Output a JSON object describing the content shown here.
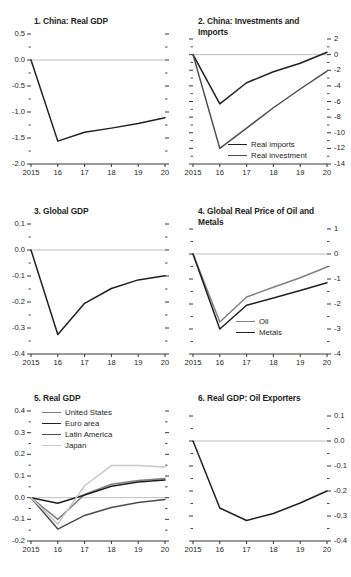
{
  "figure": {
    "width": 351,
    "height": 577,
    "background": "#ffffff",
    "x_categories": [
      "2015",
      "16",
      "17",
      "18",
      "19",
      "20"
    ]
  },
  "colors": {
    "axis": "#231f20",
    "zero_line": "#bfbfbf",
    "black": "#231f20",
    "dark_gray": "#4d4d4d",
    "mid_gray": "#808080",
    "light_gray": "#c4c4c4"
  },
  "chart_data": [
    {
      "id": "panel-1",
      "type": "line",
      "title": "1. China: Real GDP",
      "xlabel": "",
      "ylabel": "",
      "x": [
        "2015",
        "16",
        "17",
        "18",
        "19",
        "20"
      ],
      "xlim": [
        2015,
        2020
      ],
      "ylim": [
        -2.0,
        0.5
      ],
      "y_ticks": [
        "0.5",
        "0.0",
        "-0.5",
        "-1.0",
        "-1.5",
        "-2.0"
      ],
      "y_tick_values": [
        0.5,
        0.0,
        -0.5,
        -1.0,
        -1.5,
        -2.0
      ],
      "y_axis_side": "left",
      "minor_ticks": true,
      "grid": false,
      "zero_line": true,
      "legend": null,
      "series": [
        {
          "name": "China: Real GDP",
          "color": "#231f20",
          "values": [
            0.0,
            -1.56,
            -1.39,
            -1.31,
            -1.22,
            -1.11
          ]
        }
      ]
    },
    {
      "id": "panel-2",
      "type": "line",
      "title": "2. China: Investments and Imports",
      "xlabel": "",
      "ylabel": "",
      "x": [
        "2015",
        "16",
        "17",
        "18",
        "19",
        "20"
      ],
      "xlim": [
        2015,
        2020
      ],
      "ylim": [
        -14,
        2
      ],
      "y_ticks": [
        "2",
        "0",
        "-2",
        "-4",
        "-6",
        "-8",
        "-10",
        "-12",
        "-14"
      ],
      "y_tick_values": [
        2,
        0,
        -2,
        -4,
        -6,
        -8,
        -10,
        -12,
        -14
      ],
      "y_axis_side": "right",
      "minor_ticks": true,
      "grid": false,
      "zero_line": true,
      "legend": {
        "position": "bottom-center",
        "entries": [
          "Real imports",
          "Real investment"
        ]
      },
      "series": [
        {
          "name": "Real imports",
          "color": "#231f20",
          "values": [
            0.0,
            -6.3,
            -3.6,
            -2.2,
            -1.1,
            0.3
          ]
        },
        {
          "name": "Real investment",
          "color": "#4d4d4d",
          "values": [
            0.0,
            -12.0,
            -9.4,
            -6.8,
            -4.4,
            -2.1
          ]
        }
      ]
    },
    {
      "id": "panel-3",
      "type": "line",
      "title": "3. Global GDP",
      "xlabel": "",
      "ylabel": "",
      "x": [
        "2015",
        "16",
        "17",
        "18",
        "19",
        "20"
      ],
      "xlim": [
        2015,
        2020
      ],
      "ylim": [
        -0.4,
        0.1
      ],
      "y_ticks": [
        "0.1",
        "0.0",
        "-0.1",
        "-0.2",
        "-0.3",
        "-0.4"
      ],
      "y_tick_values": [
        0.1,
        0.0,
        -0.1,
        -0.2,
        -0.3,
        -0.4
      ],
      "y_axis_side": "left",
      "minor_ticks": true,
      "grid": false,
      "zero_line": true,
      "legend": null,
      "series": [
        {
          "name": "Global GDP",
          "color": "#231f20",
          "values": [
            0.0,
            -0.325,
            -0.205,
            -0.148,
            -0.115,
            -0.099
          ]
        }
      ]
    },
    {
      "id": "panel-4",
      "type": "line",
      "title": "4. Global Real Price of Oil and Metals",
      "xlabel": "",
      "ylabel": "",
      "x": [
        "2015",
        "16",
        "17",
        "18",
        "19",
        "20"
      ],
      "xlim": [
        2015,
        2020
      ],
      "ylim": [
        -4,
        1
      ],
      "y_ticks": [
        "1",
        "0",
        "-1",
        "-2",
        "-3",
        "-4"
      ],
      "y_tick_values": [
        1,
        0,
        -1,
        -2,
        -3,
        -4
      ],
      "y_axis_side": "right",
      "minor_ticks": true,
      "grid": false,
      "zero_line": true,
      "legend": {
        "position": "bottom-center",
        "entries": [
          "Oil",
          "Metals"
        ]
      },
      "series": [
        {
          "name": "Oil",
          "color": "#808080",
          "values": [
            0.0,
            -2.72,
            -1.72,
            -1.33,
            -0.95,
            -0.52
          ]
        },
        {
          "name": "Metals",
          "color": "#231f20",
          "values": [
            0.0,
            -3.0,
            -2.05,
            -1.76,
            -1.46,
            -1.15
          ]
        }
      ]
    },
    {
      "id": "panel-5",
      "type": "line",
      "title": "5. Real GDP",
      "xlabel": "",
      "ylabel": "",
      "x": [
        "2015",
        "16",
        "17",
        "18",
        "19",
        "20"
      ],
      "xlim": [
        2015,
        2020
      ],
      "ylim": [
        -0.2,
        0.4
      ],
      "y_ticks": [
        "0.4",
        "0.3",
        "0.2",
        "0.1",
        "0.0",
        "-0.1",
        "-0.2"
      ],
      "y_tick_values": [
        0.4,
        0.3,
        0.2,
        0.1,
        0.0,
        -0.1,
        -0.2
      ],
      "y_axis_side": "left",
      "minor_ticks": true,
      "grid": false,
      "zero_line": true,
      "legend": {
        "position": "top-left",
        "entries": [
          "United States",
          "Euro area",
          "Latin America",
          "Japan"
        ]
      },
      "series": [
        {
          "name": "United States",
          "color": "#808080",
          "values": [
            0.0,
            -0.1,
            0.015,
            0.062,
            0.079,
            0.088
          ]
        },
        {
          "name": "Euro area",
          "color": "#231f20",
          "values": [
            0.0,
            -0.026,
            0.012,
            0.053,
            0.072,
            0.081
          ]
        },
        {
          "name": "Latin America",
          "color": "#4d4d4d",
          "values": [
            0.0,
            -0.145,
            -0.082,
            -0.045,
            -0.022,
            -0.008
          ]
        },
        {
          "name": "Japan",
          "color": "#c8c8c8",
          "values": [
            0.0,
            -0.122,
            0.055,
            0.148,
            0.148,
            0.142
          ]
        }
      ]
    },
    {
      "id": "panel-6",
      "type": "line",
      "title": "6. Real GDP: Oil Exporters",
      "xlabel": "",
      "ylabel": "",
      "x": [
        "2015",
        "16",
        "17",
        "18",
        "19",
        "20"
      ],
      "xlim": [
        2015,
        2020
      ],
      "ylim": [
        -0.4,
        0.1
      ],
      "y_ticks": [
        "0.1",
        "0.0",
        "-0.1",
        "-0.2",
        "-0.3",
        "-0.4"
      ],
      "y_tick_values": [
        0.1,
        0.0,
        -0.1,
        -0.2,
        -0.3,
        -0.4
      ],
      "y_axis_side": "right",
      "minor_ticks": true,
      "grid": false,
      "zero_line": true,
      "legend": null,
      "series": [
        {
          "name": "Real GDP: Oil Exporters",
          "color": "#231f20",
          "values": [
            0.0,
            -0.268,
            -0.318,
            -0.29,
            -0.248,
            -0.2
          ]
        }
      ]
    }
  ]
}
